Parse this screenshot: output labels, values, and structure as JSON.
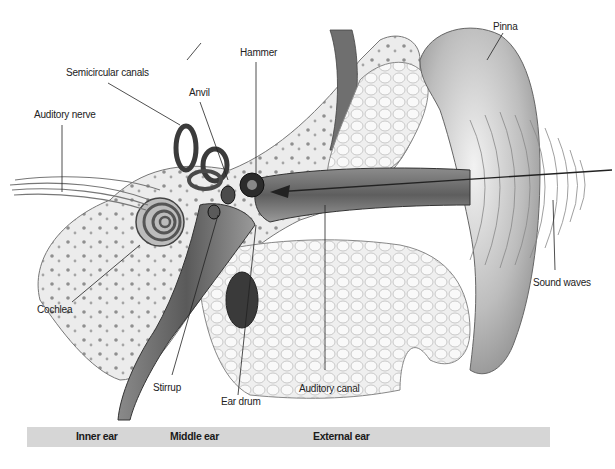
{
  "diagram": {
    "labels": {
      "auditory_nerve": "Auditory nerve",
      "semicircular_canals": "Semicircular canals",
      "anvil": "Anvil",
      "hammer": "Hammer",
      "pinna": "Pinna",
      "cochlea": "Cochlea",
      "stirrup": "Stirrup",
      "ear_drum": "Ear drum",
      "auditory_canal": "Auditory canal",
      "sound_waves": "Sound waves"
    },
    "regions": {
      "inner_ear": "Inner ear",
      "middle_ear": "Middle ear",
      "external_ear": "External ear"
    },
    "colors": {
      "region_bar": "#d6d6d6",
      "line": "#222222",
      "tissue": "#e9e9e9",
      "dark_tissue": "#4a4a4a"
    }
  }
}
